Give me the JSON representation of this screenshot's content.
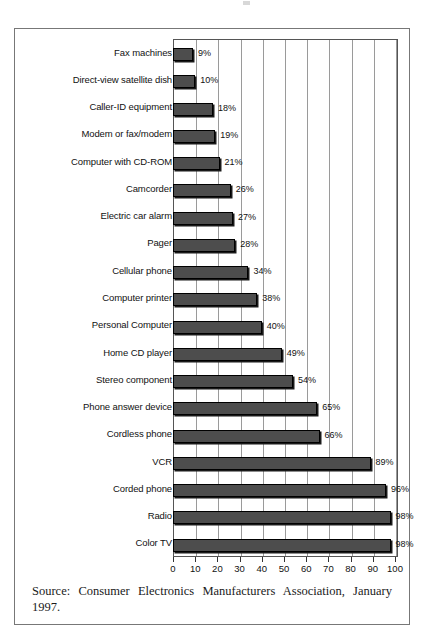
{
  "chart_data": {
    "type": "bar",
    "orientation": "horizontal",
    "title": "",
    "subtitle": "",
    "xlabel": "",
    "ylabel": "",
    "xlim": [
      0,
      100
    ],
    "xticks": [
      0,
      10,
      20,
      30,
      40,
      50,
      60,
      70,
      80,
      90,
      100
    ],
    "xtick_labels": [
      "0",
      "10",
      "20",
      "30",
      "40",
      "50",
      "60",
      "70",
      "80",
      "90",
      "100"
    ],
    "grid": true,
    "grid_axis": "x",
    "legend": false,
    "value_suffix": "%",
    "categories": [
      "Fax machines",
      "Direct-view satellite dish",
      "Caller-ID equipment",
      "Modem or fax/modem",
      "Computer with CD-ROM",
      "Camcorder",
      "Electric car alarm",
      "Pager",
      "Cellular phone",
      "Computer printer",
      "Personal Computer",
      "Home CD player",
      "Stereo component",
      "Phone answer device",
      "Cordless phone",
      "VCR",
      "Corded phone",
      "Radio",
      "Color TV"
    ],
    "values": [
      9,
      10,
      18,
      19,
      21,
      26,
      27,
      28,
      34,
      38,
      40,
      49,
      54,
      65,
      66,
      89,
      96,
      98,
      98
    ],
    "value_labels": [
      "9%",
      "10%",
      "18%",
      "19%",
      "21%",
      "26%",
      "27%",
      "28%",
      "34%",
      "38%",
      "40%",
      "49%",
      "54%",
      "65%",
      "66%",
      "89%",
      "96%",
      "98%",
      "98%"
    ],
    "bar_color": "#4d4d4d",
    "bar_border_color": "#000000",
    "gridline_color": "#9a9a9a",
    "axis_color": "#555555"
  },
  "source": {
    "text": "Source: Consumer Electronics Manufacturers Association, January 1997."
  }
}
